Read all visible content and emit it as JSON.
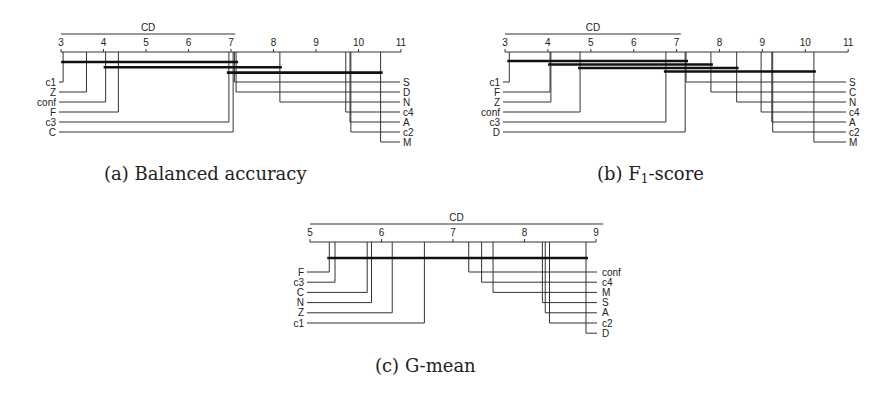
{
  "chart_data": [
    {
      "type": "critical-difference",
      "title": "(a) Balanced accuracy",
      "caption_prefix": "(a)",
      "caption_text": "Balanced accuracy",
      "cd_label": "CD",
      "cd_value": 4.1,
      "axis_range": [
        3,
        11
      ],
      "ticks": [
        3,
        4,
        5,
        6,
        7,
        8,
        9,
        10,
        11
      ],
      "left_methods": [
        {
          "name": "c1",
          "rank": 3.05
        },
        {
          "name": "Z",
          "rank": 3.6
        },
        {
          "name": "conf",
          "rank": 4.05
        },
        {
          "name": "F",
          "rank": 4.35
        },
        {
          "name": "c3",
          "rank": 6.95
        },
        {
          "name": "C",
          "rank": 7.05
        }
      ],
      "right_methods": [
        {
          "name": "S",
          "rank": 7.08
        },
        {
          "name": "D",
          "rank": 7.12
        },
        {
          "name": "N",
          "rank": 8.15
        },
        {
          "name": "c4",
          "rank": 9.7
        },
        {
          "name": "A",
          "rank": 9.8
        },
        {
          "name": "c2",
          "rank": 9.82
        },
        {
          "name": "M",
          "rank": 10.52
        }
      ],
      "cliques": [
        [
          3.05,
          7.12
        ],
        [
          4.05,
          8.15
        ],
        [
          6.95,
          10.52
        ]
      ]
    },
    {
      "type": "critical-difference",
      "title": "(b) F1-score",
      "caption_prefix": "(b)",
      "caption_text": "F",
      "caption_sub": "1",
      "caption_suffix": "-score",
      "cd_label": "CD",
      "cd_value": 4.1,
      "axis_range": [
        3,
        11
      ],
      "ticks": [
        3,
        4,
        5,
        6,
        7,
        8,
        9,
        10,
        11
      ],
      "left_methods": [
        {
          "name": "c1",
          "rank": 3.1
        },
        {
          "name": "F",
          "rank": 4.05
        },
        {
          "name": "Z",
          "rank": 4.07
        },
        {
          "name": "conf",
          "rank": 4.75
        },
        {
          "name": "c3",
          "rank": 6.75
        },
        {
          "name": "D",
          "rank": 7.2
        }
      ],
      "right_methods": [
        {
          "name": "S",
          "rank": 7.22
        },
        {
          "name": "C",
          "rank": 7.8
        },
        {
          "name": "N",
          "rank": 8.4
        },
        {
          "name": "c4",
          "rank": 8.97
        },
        {
          "name": "A",
          "rank": 9.22
        },
        {
          "name": "c2",
          "rank": 9.24
        },
        {
          "name": "M",
          "rank": 10.2
        }
      ],
      "cliques": [
        [
          3.1,
          7.22
        ],
        [
          4.05,
          7.8
        ],
        [
          4.75,
          8.4
        ],
        [
          6.75,
          10.2
        ]
      ]
    },
    {
      "type": "critical-difference",
      "title": "(c) G-mean",
      "caption_prefix": "(c)",
      "caption_text": "G-mean",
      "cd_label": "CD",
      "cd_value": 4.1,
      "axis_range": [
        5,
        9
      ],
      "ticks": [
        5,
        6,
        7,
        8,
        9
      ],
      "left_methods": [
        {
          "name": "F",
          "rank": 5.27
        },
        {
          "name": "c3",
          "rank": 5.35
        },
        {
          "name": "C",
          "rank": 5.8
        },
        {
          "name": "N",
          "rank": 5.86
        },
        {
          "name": "Z",
          "rank": 6.15
        },
        {
          "name": "c1",
          "rank": 6.6
        }
      ],
      "right_methods": [
        {
          "name": "conf",
          "rank": 7.22
        },
        {
          "name": "c4",
          "rank": 7.4
        },
        {
          "name": "M",
          "rank": 7.56
        },
        {
          "name": "S",
          "rank": 8.25
        },
        {
          "name": "A",
          "rank": 8.29
        },
        {
          "name": "c2",
          "rank": 8.35
        },
        {
          "name": "D",
          "rank": 8.86
        }
      ],
      "cliques": [
        [
          5.27,
          8.86
        ]
      ]
    }
  ],
  "layout": [
    {
      "x0": 61,
      "scale": 42.5,
      "axis_y": 52,
      "cd_y": 34,
      "label_y": 46,
      "first_row_y": 82,
      "row_gap": 10,
      "clique_y0": 62,
      "clique_gap": 5.3,
      "left_label_x": 56,
      "right_line_x": 400,
      "right_label_x": 403,
      "caption_x": 104,
      "caption_y": 163
    },
    {
      "x0": 505,
      "scale": 42.9,
      "axis_y": 52,
      "cd_y": 34,
      "label_y": 46,
      "first_row_y": 82,
      "row_gap": 10,
      "clique_y0": 61,
      "clique_gap": 3.5,
      "left_label_x": 500,
      "right_line_x": 846,
      "right_label_x": 849,
      "caption_x": 597,
      "caption_y": 163
    },
    {
      "x0": 310,
      "scale": 71.5,
      "axis_y": 242,
      "cd_y": 224,
      "label_y": 236,
      "first_row_y": 272,
      "row_gap": 10.2,
      "clique_y0": 258,
      "clique_gap": 5,
      "left_label_x": 304,
      "right_line_x": 597,
      "right_label_x": 602,
      "caption_x": 375,
      "caption_y": 355
    }
  ]
}
